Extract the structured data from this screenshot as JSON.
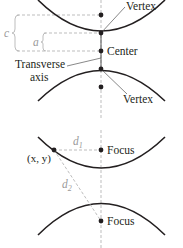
{
  "diagram_top": {
    "labels": {
      "vertex_top": "Vertex",
      "center": "Center",
      "transverse_line1": "Transverse",
      "transverse_line2": "axis",
      "vertex_bottom": "Vertex",
      "c": "c",
      "a": "a"
    }
  },
  "diagram_bottom": {
    "labels": {
      "focus_top": "Focus",
      "focus_bottom": "Focus",
      "point": "(x, y)",
      "d1_base": "d",
      "d1_sub": "1",
      "d2_base": "d",
      "d2_sub": "2"
    }
  },
  "colors": {
    "curve": "#231f20",
    "dashed": "#b5b5b5",
    "text": "#231f20",
    "muted_text": "#9a9a9a"
  }
}
